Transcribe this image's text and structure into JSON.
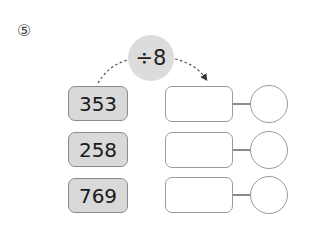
{
  "problem": {
    "number": "⑤",
    "operator": "÷8",
    "rows": [
      {
        "value": "353",
        "quotient": "",
        "remainder": ""
      },
      {
        "value": "258",
        "quotient": "",
        "remainder": ""
      },
      {
        "value": "769",
        "quotient": "",
        "remainder": ""
      }
    ]
  }
}
